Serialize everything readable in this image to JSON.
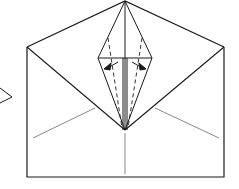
{
  "diagram": {
    "type": "origami-fold-step",
    "colors": {
      "line": "#1a1a1a",
      "thin": "#555555",
      "background": "#ffffff"
    },
    "elements": [
      "paper-outline",
      "top-flap-triangle",
      "kite-diamond",
      "valley-fold-dashed-lines",
      "fold-arrows",
      "crease-lines",
      "step-arrow"
    ]
  }
}
